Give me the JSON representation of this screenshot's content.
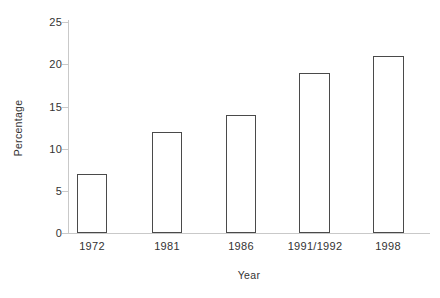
{
  "chart_data": {
    "type": "bar",
    "title": "",
    "subtitle": "",
    "categories": [
      "1972",
      "1981",
      "1986",
      "1991/1992",
      "1998"
    ],
    "values": [
      7,
      12,
      14,
      19,
      21
    ],
    "xlabel": "Year",
    "ylabel": "Percentage",
    "ylim": [
      0,
      25
    ],
    "ytick_labels": [
      "0",
      "5",
      "10",
      "15",
      "20",
      "25"
    ],
    "ytick_values": [
      0,
      5,
      10,
      15,
      20,
      25
    ],
    "ytick_step": 5,
    "grid": false,
    "legend": null,
    "legend_position": "none",
    "annotations": [],
    "series": [
      {
        "name": "Percentage",
        "values": [
          7,
          12,
          14,
          19,
          21
        ]
      }
    ],
    "style": {
      "bar_fill": "#ffffff",
      "bar_border": "#4a4a4a",
      "axis_color": "#c9c9c9",
      "text_color": "#333333",
      "background": "#ffffff"
    }
  }
}
